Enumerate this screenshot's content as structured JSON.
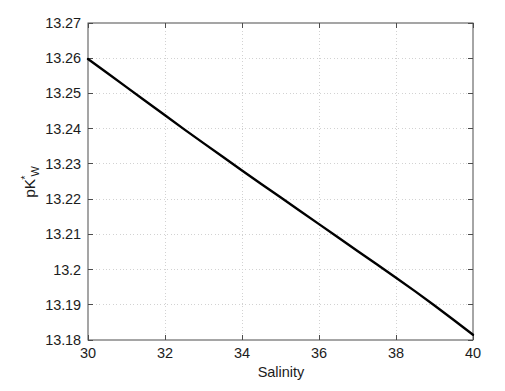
{
  "chart_data": {
    "type": "line",
    "title": "",
    "xlabel": "Salinity",
    "ylabel": "pK*W",
    "ylabel_parts": {
      "base": "pK",
      "superscript": "*",
      "subscript": "W"
    },
    "xlim": [
      30,
      40
    ],
    "ylim": [
      13.18,
      13.27
    ],
    "xticks": [
      30,
      32,
      34,
      36,
      38,
      40
    ],
    "xtick_labels": [
      "30",
      "32",
      "34",
      "36",
      "38",
      "40"
    ],
    "yticks": [
      13.18,
      13.19,
      13.2,
      13.21,
      13.22,
      13.23,
      13.24,
      13.25,
      13.26,
      13.27
    ],
    "ytick_labels": [
      "13.18",
      "13.19",
      "13.2",
      "13.21",
      "13.22",
      "13.23",
      "13.24",
      "13.25",
      "13.26",
      "13.27"
    ],
    "grid": true,
    "grid_style": "dotted",
    "grid_color": "#d2d2d2",
    "axis_color": "#4d4d4d",
    "line_color": "#000000",
    "line_width": 2.4,
    "legend": null,
    "series": [
      {
        "name": "pKw* vs Salinity",
        "x": [
          30,
          30.5,
          31,
          31.5,
          32,
          32.5,
          33,
          33.5,
          34,
          34.5,
          35,
          35.5,
          36,
          36.5,
          37,
          37.5,
          38,
          38.5,
          39,
          39.5,
          40
        ],
        "y": [
          13.2598,
          13.2558,
          13.2518,
          13.2478,
          13.2438,
          13.2398,
          13.2359,
          13.232,
          13.2281,
          13.2243,
          13.2205,
          13.2167,
          13.2129,
          13.2091,
          13.2053,
          13.2015,
          13.1977,
          13.1938,
          13.1898,
          13.1857,
          13.1815
        ]
      }
    ]
  },
  "figure": {
    "background_color": "#ffffff",
    "plot_box": {
      "left": 88,
      "top": 23,
      "right": 473,
      "bottom": 340
    }
  }
}
